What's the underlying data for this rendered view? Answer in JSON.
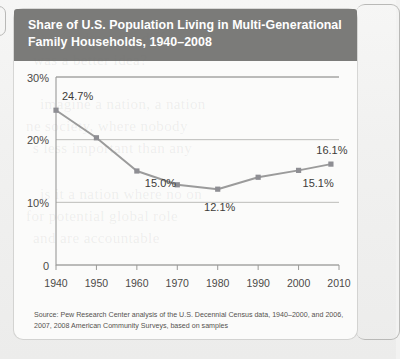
{
  "header": {
    "title": "Share of U.S. Population Living in Multi-Generational Family Households, 1940–2008"
  },
  "source": {
    "note": "Source: Pew Research Center analysis of the U.S. Decennial Census data, 1940–2000, and 2006, 2007, 2008 American Community Surveys, based on samples"
  },
  "colors": {
    "banner_bg": "#7b7b79",
    "banner_text": "#ffffff",
    "card_bg": "#fbfbfa",
    "page_bg": "#f2f2f1",
    "line": "#9b9b9b",
    "marker": "#8e8e93",
    "gridline": "#bcbcba",
    "axis": "#9a9a98",
    "tick_label": "#4c4a48",
    "data_label": "#3d3b39"
  },
  "bleed_text": [
    "ant to address the differ",
    "was a better idea?",
    "imagine a nation, a nation",
    "ne society, where nobody",
    "s less important than any",
    "is it a nation where no on",
    "for potential global role",
    "and are accountable"
  ],
  "chart_data": {
    "type": "line",
    "title": "Share of U.S. Population Living in Multi-Generational Family Households, 1940–2008",
    "xlabel": "",
    "ylabel": "",
    "x": [
      1940,
      1950,
      1960,
      1970,
      1980,
      1990,
      2000,
      2008
    ],
    "values": [
      24.7,
      20.3,
      15.0,
      12.8,
      12.1,
      14.0,
      15.1,
      16.1
    ],
    "point_labels": [
      "24.7%",
      "",
      "15.0%",
      "",
      "12.1%",
      "",
      "15.1%",
      "16.1%"
    ],
    "xlim": [
      1940,
      2010
    ],
    "ylim": [
      0,
      30
    ],
    "xticks": [
      1940,
      1950,
      1960,
      1970,
      1980,
      1990,
      2000,
      2010
    ],
    "xticklabels": [
      "1940",
      "1950",
      "1960",
      "1970",
      "1980",
      "1990",
      "2000",
      "2010"
    ],
    "yticks": [
      0,
      10,
      20,
      30
    ],
    "yticklabels": [
      "0",
      "10%",
      "20%",
      "30%"
    ],
    "grid": true,
    "legend": false,
    "marker": "square"
  }
}
